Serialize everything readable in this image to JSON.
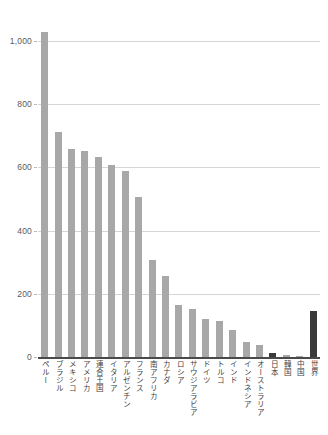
{
  "chart_data": {
    "type": "bar",
    "title": "",
    "subtitle": "",
    "xlabel": "",
    "ylabel": "",
    "ylim": [
      0,
      1000
    ],
    "yticks": [
      0,
      200,
      400,
      600,
      800,
      1000
    ],
    "ytick_labels": [
      "0",
      "200",
      "400",
      "600",
      "800",
      "1,000"
    ],
    "grid": true,
    "legend": "none",
    "categories": [
      "ペルー",
      "ブラジル",
      "メキシコ",
      "アメリカ",
      "連合王国",
      "イタリア",
      "アルゼンチン",
      "フランス",
      "南アフリカ",
      "カナダ",
      "ロシア",
      "サウジアラビア",
      "ドイツ",
      "トルコ",
      "インド",
      "インドネシア",
      "オーストラリア",
      "日本",
      "韓国",
      "中国",
      "世界"
    ],
    "values": [
      1030,
      712,
      658,
      653,
      632,
      608,
      590,
      507,
      307,
      255,
      166,
      151,
      119,
      113,
      86,
      47,
      37,
      12,
      6,
      3,
      146
    ],
    "bar_colors": [
      "#a8a8a8",
      "#a8a8a8",
      "#a8a8a8",
      "#a8a8a8",
      "#a8a8a8",
      "#a8a8a8",
      "#a8a8a8",
      "#a8a8a8",
      "#a8a8a8",
      "#a8a8a8",
      "#a8a8a8",
      "#a8a8a8",
      "#a8a8a8",
      "#a8a8a8",
      "#a8a8a8",
      "#a8a8a8",
      "#a8a8a8",
      "#3a3a3a",
      "#a8a8a8",
      "#a8a8a8",
      "#3a3a3a"
    ],
    "highlighted": [
      "日本",
      "世界"
    ],
    "colors": {
      "bar_default": "#a8a8a8",
      "bar_highlight": "#3a3a3a",
      "gridline": "#d6d6d6",
      "axis": "#4a4a4a",
      "tick_text": "#5a5a5a",
      "label_text": "#3f3f3f",
      "background": "#ffffff"
    }
  }
}
